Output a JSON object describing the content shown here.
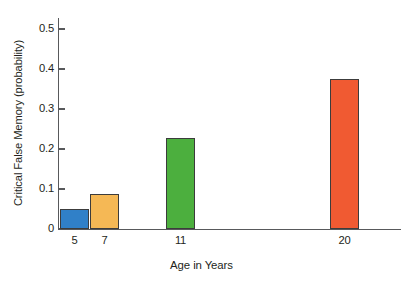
{
  "chart_data": {
    "type": "bar",
    "title": "",
    "xlabel": "Age in Years",
    "ylabel": "Critical False Memory (probability)",
    "categories": [
      "5",
      "7",
      "11",
      "20"
    ],
    "x_values": [
      5,
      7,
      11,
      20
    ],
    "values": [
      0.05,
      0.0875,
      0.2275,
      0.375
    ],
    "series": [
      {
        "name": "Critical False Memory",
        "values": [
          0.05,
          0.0875,
          0.2275,
          0.375
        ]
      }
    ],
    "bar_colors": [
      "#3080c8",
      "#f5b855",
      "#4caf3e",
      "#f05a32"
    ],
    "bar_border_color": "#3c3c3c",
    "ylim": [
      0,
      0.5
    ],
    "ytick_labels": [
      "0",
      "0.1",
      "0.2",
      "0.3",
      "0.4",
      "0.5"
    ],
    "ytick_values": [
      0,
      0.1,
      0.2,
      0.3,
      0.4,
      0.5
    ],
    "grid": false,
    "legend": "none",
    "axis_color": "#58595b",
    "background": "#ffffff"
  }
}
